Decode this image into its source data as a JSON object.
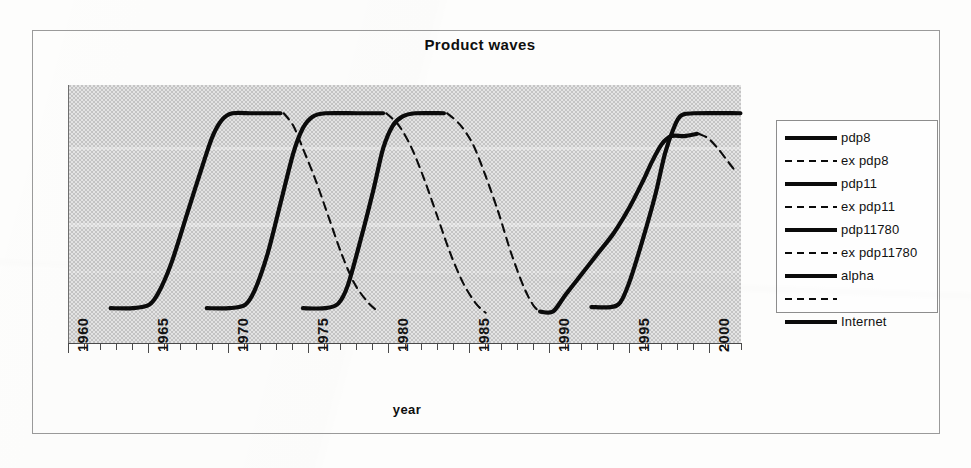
{
  "chart_data": {
    "type": "line",
    "title": "Product waves",
    "xlabel": "year",
    "ylabel": "",
    "xlim": [
      1960,
      2002
    ],
    "ylim": [
      0,
      1
    ],
    "grid": false,
    "legend_position": "right",
    "x_tick_labels": [
      "1960",
      "1965",
      "1970",
      "1975",
      "1980",
      "1985",
      "1990",
      "1995",
      "2000"
    ],
    "x_tick_values": [
      1960,
      1965,
      1970,
      1975,
      1980,
      1985,
      1990,
      1995,
      2000
    ],
    "x_minor_tick_step": 1,
    "series": [
      {
        "name": "pdp8",
        "style": "solid",
        "points": [
          [
            1962.6,
            0.1
          ],
          [
            1964.0,
            0.1
          ],
          [
            1965.0,
            0.115
          ],
          [
            1965.6,
            0.17
          ],
          [
            1966.4,
            0.3
          ],
          [
            1967.4,
            0.52
          ],
          [
            1968.4,
            0.74
          ],
          [
            1969.0,
            0.86
          ],
          [
            1969.6,
            0.93
          ],
          [
            1970.2,
            0.955
          ],
          [
            1971.5,
            0.955
          ],
          [
            1973.2,
            0.955
          ]
        ]
      },
      {
        "name": "ex pdp8",
        "style": "dashed",
        "points": [
          [
            1973.4,
            0.955
          ],
          [
            1974.0,
            0.9
          ],
          [
            1974.6,
            0.8
          ],
          [
            1975.4,
            0.66
          ],
          [
            1976.2,
            0.5
          ],
          [
            1977.0,
            0.34
          ],
          [
            1977.8,
            0.21
          ],
          [
            1978.6,
            0.13
          ],
          [
            1979.2,
            0.09
          ]
        ]
      },
      {
        "name": "pdp11",
        "style": "solid",
        "points": [
          [
            1968.6,
            0.1
          ],
          [
            1970.0,
            0.1
          ],
          [
            1971.0,
            0.115
          ],
          [
            1971.6,
            0.18
          ],
          [
            1972.4,
            0.34
          ],
          [
            1973.2,
            0.56
          ],
          [
            1974.0,
            0.78
          ],
          [
            1974.6,
            0.89
          ],
          [
            1975.2,
            0.94
          ],
          [
            1976.0,
            0.955
          ],
          [
            1978.0,
            0.955
          ],
          [
            1979.6,
            0.955
          ]
        ]
      },
      {
        "name": "ex pdp11",
        "style": "dashed",
        "points": [
          [
            1979.8,
            0.955
          ],
          [
            1980.6,
            0.9
          ],
          [
            1981.4,
            0.8
          ],
          [
            1982.2,
            0.66
          ],
          [
            1983.0,
            0.5
          ],
          [
            1983.8,
            0.34
          ],
          [
            1984.6,
            0.21
          ],
          [
            1985.4,
            0.12
          ],
          [
            1986.0,
            0.08
          ]
        ]
      },
      {
        "name": "pdp11780",
        "style": "solid",
        "points": [
          [
            1974.6,
            0.1
          ],
          [
            1976.0,
            0.1
          ],
          [
            1976.8,
            0.12
          ],
          [
            1977.4,
            0.2
          ],
          [
            1978.2,
            0.4
          ],
          [
            1979.0,
            0.62
          ],
          [
            1979.6,
            0.8
          ],
          [
            1980.2,
            0.9
          ],
          [
            1980.8,
            0.94
          ],
          [
            1981.6,
            0.955
          ],
          [
            1983.4,
            0.955
          ]
        ]
      },
      {
        "name": "ex pdp11780",
        "style": "dashed",
        "points": [
          [
            1983.6,
            0.955
          ],
          [
            1984.4,
            0.905
          ],
          [
            1985.2,
            0.82
          ],
          [
            1986.0,
            0.68
          ],
          [
            1986.8,
            0.52
          ],
          [
            1987.6,
            0.34
          ],
          [
            1988.4,
            0.19
          ],
          [
            1989.0,
            0.11
          ],
          [
            1989.4,
            0.085
          ]
        ]
      },
      {
        "name": "alpha",
        "style": "solid",
        "points": [
          [
            1989.4,
            0.085
          ],
          [
            1990.2,
            0.085
          ],
          [
            1991.0,
            0.16
          ],
          [
            1992.0,
            0.25
          ],
          [
            1993.0,
            0.34
          ],
          [
            1994.0,
            0.43
          ],
          [
            1995.0,
            0.545
          ],
          [
            1995.8,
            0.655
          ],
          [
            1996.4,
            0.745
          ],
          [
            1997.0,
            0.82
          ],
          [
            1997.6,
            0.855
          ],
          [
            1998.4,
            0.855
          ],
          [
            1999.2,
            0.865
          ]
        ]
      },
      {
        "name": "",
        "style": "dashed",
        "points": [
          [
            1999.3,
            0.865
          ],
          [
            1999.9,
            0.845
          ],
          [
            2000.5,
            0.8
          ],
          [
            2001.1,
            0.745
          ],
          [
            2001.6,
            0.7
          ]
        ]
      },
      {
        "name": "Internet",
        "style": "solid",
        "points": [
          [
            1992.6,
            0.105
          ],
          [
            1993.8,
            0.105
          ],
          [
            1994.4,
            0.125
          ],
          [
            1995.0,
            0.22
          ],
          [
            1995.8,
            0.4
          ],
          [
            1996.6,
            0.6
          ],
          [
            1997.2,
            0.78
          ],
          [
            1997.8,
            0.9
          ],
          [
            1998.2,
            0.945
          ],
          [
            1999.0,
            0.955
          ],
          [
            2001.9,
            0.955
          ]
        ]
      }
    ]
  },
  "legend": {
    "items": [
      {
        "label": "pdp8",
        "style": "solid"
      },
      {
        "label": "ex pdp8",
        "style": "dashed"
      },
      {
        "label": "pdp11",
        "style": "solid"
      },
      {
        "label": "ex pdp11",
        "style": "dashed"
      },
      {
        "label": "pdp11780",
        "style": "solid"
      },
      {
        "label": "ex pdp11780",
        "style": "dashed"
      },
      {
        "label": "alpha",
        "style": "solid"
      },
      {
        "label": "",
        "style": "dashed"
      },
      {
        "label": "Internet",
        "style": "solid"
      }
    ]
  },
  "colors": {
    "line": "#0b0b0b",
    "plot_background": "#c4c4c4",
    "frame": "#9a9a9a",
    "axis": "#4a4a4a",
    "text": "#111111",
    "page_background": "#fdfdfc"
  }
}
